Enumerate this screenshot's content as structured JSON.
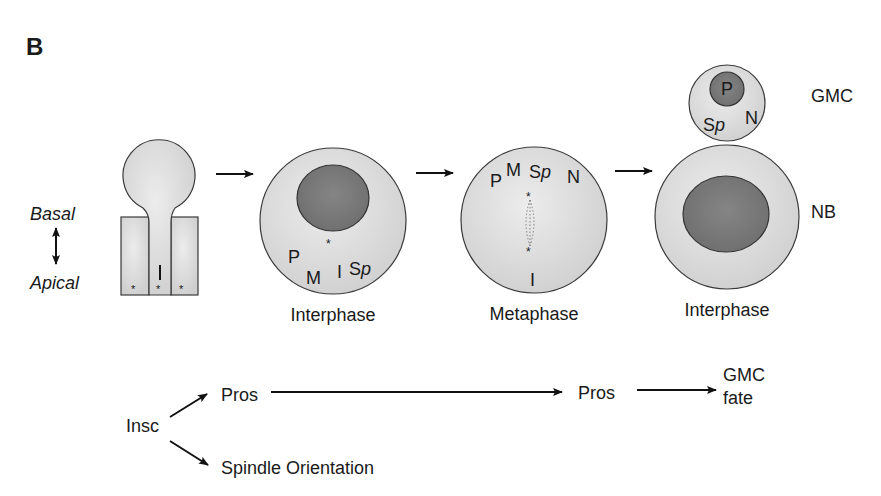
{
  "panel": {
    "label": "B"
  },
  "colors": {
    "cytoplasm": "#d4d4d4",
    "cytoplasm_light": "#e6e6e6",
    "nucleus": "#7a7a7a",
    "outline": "#3a3a3a",
    "text": "#1a1a1a"
  },
  "axis": {
    "basal": "Basal",
    "apical": "Apical",
    "icon": "double-headed-vertical-arrow"
  },
  "stages": [
    {
      "id": "neuroepithelium",
      "caption": "",
      "labels": {
        "inscuteable": "I",
        "centrosome_marks": [
          "*",
          "*",
          "*"
        ]
      }
    },
    {
      "id": "interphase-nb",
      "caption": "Interphase",
      "labels": {
        "p": "P",
        "m": "M",
        "i": "I",
        "sp_s": "S",
        "sp_p": "p",
        "star": "*"
      }
    },
    {
      "id": "metaphase-nb",
      "caption": "Metaphase",
      "labels": {
        "p": "P",
        "m": "M",
        "sp_s": "S",
        "sp_p": "p",
        "n": "N",
        "i": "I",
        "star_top": "*",
        "star_bottom": "*"
      }
    },
    {
      "id": "interphase-division",
      "caption": "Interphase",
      "gmc": {
        "name": "GMC",
        "p": "P",
        "sp_s": "S",
        "sp_p": "p",
        "n": "N"
      },
      "nb": {
        "name": "NB"
      }
    }
  ],
  "pathway": {
    "source": "Insc",
    "branch_top": "Pros",
    "branch_bottom": "Spindle Orientation",
    "middle": "Pros",
    "outcome_line1": "GMC",
    "outcome_line2": "fate"
  }
}
